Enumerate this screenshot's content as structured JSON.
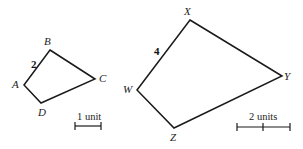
{
  "figures": [
    {
      "name": "ABCD",
      "vertices": [
        {
          "label": "B",
          "x": 50,
          "y": 50,
          "lx": 44,
          "ly": 45
        },
        {
          "label": "C",
          "x": 95,
          "y": 79,
          "lx": 99,
          "ly": 82
        },
        {
          "label": "D",
          "x": 41,
          "y": 103,
          "lx": 38,
          "ly": 116
        },
        {
          "label": "A",
          "x": 24,
          "y": 85,
          "lx": 12,
          "ly": 88
        }
      ],
      "side_label": {
        "text": "2",
        "x": 31,
        "y": 68
      }
    },
    {
      "name": "WXYZ",
      "vertices": [
        {
          "label": "X",
          "x": 190,
          "y": 20,
          "lx": 184,
          "ly": 15
        },
        {
          "label": "Y",
          "x": 282,
          "y": 76,
          "lx": 284,
          "ly": 80
        },
        {
          "label": "Z",
          "x": 174,
          "y": 128,
          "lx": 170,
          "ly": 141
        },
        {
          "label": "W",
          "x": 137,
          "y": 90,
          "lx": 123,
          "ly": 93
        }
      ],
      "side_label": {
        "text": "4",
        "x": 154,
        "y": 55
      }
    }
  ],
  "scales": [
    {
      "text": "1 unit",
      "x1": 75,
      "x2": 101,
      "y": 126,
      "ticks": [
        75,
        101
      ],
      "tx": 77,
      "ty": 120
    },
    {
      "text": "2 units",
      "x1": 237,
      "x2": 290,
      "y": 127,
      "ticks": [
        237,
        263,
        290
      ],
      "tx": 249,
      "ty": 120
    }
  ]
}
